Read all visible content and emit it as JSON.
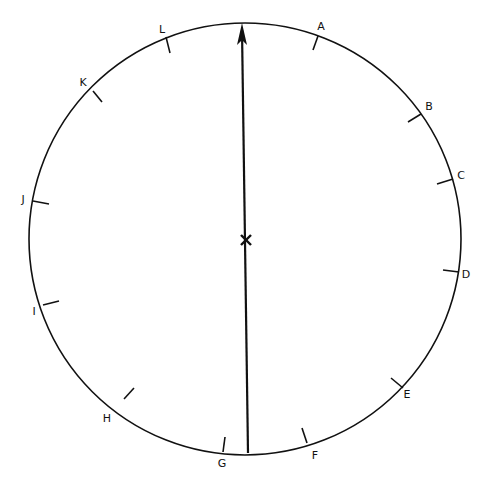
{
  "diagram": {
    "type": "dial",
    "center": [
      245,
      239
    ],
    "radius": 216,
    "stroke_color": "#111111",
    "arrow": {
      "from": [
        248,
        453
      ],
      "to": [
        242,
        24
      ]
    },
    "center_mark": "x",
    "ticks": [
      {
        "label": "A",
        "p": [
          318,
          36
        ],
        "t": [
          313,
          50
        ],
        "l": [
          321,
          27
        ]
      },
      {
        "label": "B",
        "p": [
          421,
          114
        ],
        "t": [
          408,
          122
        ],
        "l": [
          429,
          107
        ]
      },
      {
        "label": "C",
        "p": [
          453,
          179
        ],
        "t": [
          437,
          184
        ],
        "l": [
          461,
          176
        ]
      },
      {
        "label": "D",
        "p": [
          459,
          272
        ],
        "t": [
          443,
          270
        ],
        "l": [
          466,
          275
        ]
      },
      {
        "label": "E",
        "p": [
          403,
          388
        ],
        "t": [
          391,
          378
        ],
        "l": [
          407,
          395
        ]
      },
      {
        "label": "F",
        "p": [
          307,
          443
        ],
        "t": [
          302,
          428
        ],
        "l": [
          315,
          456
        ]
      },
      {
        "label": "G",
        "p": [
          223,
          452
        ],
        "t": [
          225,
          437
        ],
        "l": [
          222,
          464
        ]
      },
      {
        "label": "H",
        "p": [
          124,
          399
        ],
        "t": [
          134,
          388
        ],
        "l": [
          107,
          419
        ]
      },
      {
        "label": "I",
        "p": [
          43,
          305
        ],
        "t": [
          59,
          301
        ],
        "l": [
          34,
          312
        ]
      },
      {
        "label": "J",
        "p": [
          33,
          201
        ],
        "t": [
          49,
          204
        ],
        "l": [
          23,
          200
        ]
      },
      {
        "label": "K",
        "p": [
          93,
          91
        ],
        "t": [
          102,
          102
        ],
        "l": [
          83,
          83
        ]
      },
      {
        "label": "L",
        "p": [
          166,
          37
        ],
        "t": [
          170,
          53
        ],
        "l": [
          162,
          30
        ]
      }
    ]
  }
}
